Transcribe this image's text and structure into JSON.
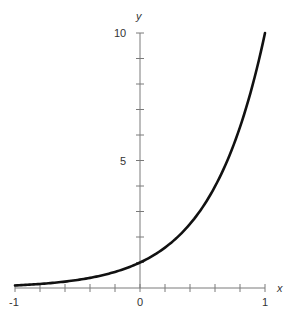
{
  "chart_data": {
    "type": "line",
    "title": "",
    "function": "y = 10^x",
    "xlabel": "x",
    "ylabel": "y",
    "xlim": [
      -1,
      1
    ],
    "ylim": [
      0,
      10
    ],
    "grid": false,
    "x_tick_labels": [
      "-1",
      "0",
      "1"
    ],
    "y_tick_labels": [
      "5",
      "10"
    ],
    "x_tick_step": 0.2,
    "y_tick_step": 1,
    "series": [
      {
        "name": "10^x",
        "x": [
          -1.0,
          -0.8,
          -0.6,
          -0.4,
          -0.2,
          0.0,
          0.2,
          0.4,
          0.6,
          0.8,
          1.0
        ],
        "y": [
          0.1,
          0.158,
          0.251,
          0.398,
          0.631,
          1.0,
          1.585,
          2.512,
          3.981,
          6.31,
          10.0
        ]
      }
    ]
  },
  "labels": {
    "x_axis": "x",
    "y_axis": "y",
    "x_min": "-1",
    "x_zero": "0",
    "x_max": "1",
    "y_mid": "5",
    "y_max": "10"
  }
}
